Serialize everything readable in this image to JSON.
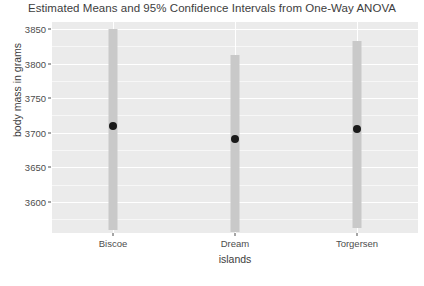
{
  "chart_data": {
    "type": "scatter",
    "title": "Estimated Means and 95% Confidence Intervals from One-Way ANOVA",
    "xlabel": "islands",
    "ylabel": "body mass in grams",
    "categories": [
      "Biscoe",
      "Dream",
      "Torgersen"
    ],
    "values": [
      3709,
      3691,
      3706
    ],
    "ci_lower": [
      3560,
      3557,
      3562
    ],
    "ci_upper": [
      3850,
      3812,
      3833
    ],
    "ylim": [
      3555,
      3860
    ],
    "yticks": [
      3600,
      3650,
      3700,
      3750,
      3800,
      3850
    ],
    "ytick_labels": [
      "3600",
      "3650",
      "3700",
      "3750",
      "3800",
      "3850"
    ],
    "grid": true,
    "legend": "none",
    "panel_color": "#ebebeb",
    "grid_color": "#ffffff",
    "bar_color": "#c9c9c9",
    "point_color": "#1a1a1a",
    "series": [
      {
        "name": "Estimated mean",
        "values": [
          3709,
          3691,
          3706
        ]
      }
    ],
    "note_clipped_bars": "Confidence interval bars extend below the lower panel edge"
  }
}
